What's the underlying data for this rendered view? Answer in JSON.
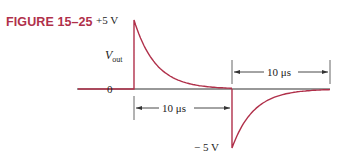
{
  "figure": {
    "label": "FIGURE 15–25",
    "y_axis_label_main": "V",
    "y_axis_label_sub": "out",
    "level_high": "+5 V",
    "level_zero": "0",
    "level_low": "− 5 V",
    "interval_1": "10 μs",
    "interval_2": "10 μs",
    "curve_color": "#b0304a",
    "waveform": {
      "description": "Exponential positive pulse decaying from +5 V to 0 over 10 μs, then negative spike to −5 V recovering exponentially to 0 over 10 μs",
      "peak_positive_v": 5,
      "peak_negative_v": -5,
      "segment_duration_us": 10
    }
  }
}
